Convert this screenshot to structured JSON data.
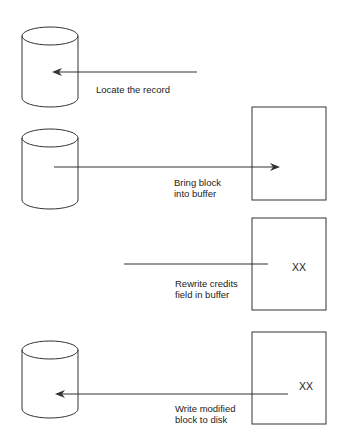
{
  "diagram": {
    "colors": {
      "stroke": "#333333",
      "background": "#ffffff",
      "text": "#222222"
    },
    "steps": [
      {
        "label_lines": [
          "Locate the record"
        ]
      },
      {
        "label_lines": [
          "Bring block",
          "into buffer"
        ]
      },
      {
        "label_lines": [
          "Rewrite credits",
          "field in buffer"
        ],
        "buffer_value": "XX"
      },
      {
        "label_lines": [
          "Write modified",
          "block to disk"
        ],
        "buffer_value": "XX"
      }
    ],
    "shapes": {
      "disk": "disk-cylinder-icon",
      "buffer": "buffer-rectangle"
    }
  }
}
